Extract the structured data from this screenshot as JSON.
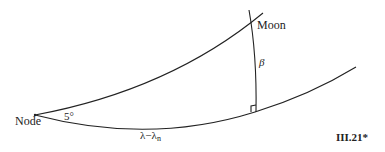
{
  "diagram": {
    "labels": {
      "moon": "Moon",
      "node": "Node",
      "beta": "β",
      "inclination": "5°",
      "longitude_diff": "λ−λ",
      "longitude_sub": "n",
      "figure_number": "III.21*"
    },
    "elements": [
      {
        "id": "orbit-arc",
        "description": "Moon's orbit great circle from Node through Moon"
      },
      {
        "id": "ecliptic-arc",
        "description": "Ecliptic great circle from Node"
      },
      {
        "id": "latitude-arc",
        "description": "Arc β perpendicular to ecliptic through Moon"
      },
      {
        "id": "right-angle-marker",
        "description": "Right angle at foot of β arc on ecliptic"
      }
    ],
    "colors": {
      "stroke": "#222222",
      "background": "#ffffff"
    }
  }
}
